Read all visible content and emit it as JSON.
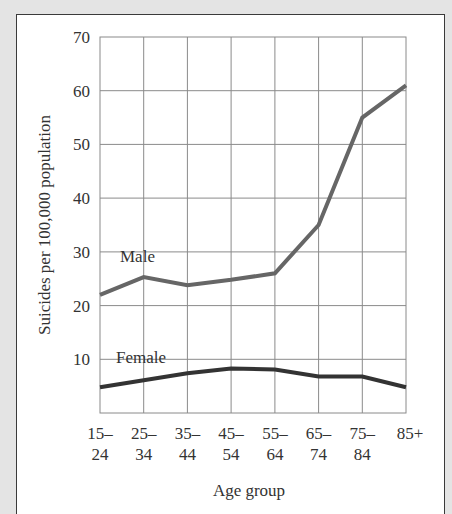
{
  "chart_data": {
    "type": "line",
    "title": "",
    "xlabel": "Age group",
    "ylabel": "Suicides per 100,000 population",
    "categories": [
      "15–24",
      "25–34",
      "35–44",
      "45–54",
      "55–64",
      "65–74",
      "75–84",
      "85+"
    ],
    "category_lines": [
      [
        "15–",
        "24"
      ],
      [
        "25–",
        "34"
      ],
      [
        "35–",
        "44"
      ],
      [
        "45–",
        "54"
      ],
      [
        "55–",
        "64"
      ],
      [
        "65–",
        "74"
      ],
      [
        "75–",
        "84"
      ],
      [
        "85+",
        ""
      ]
    ],
    "yticks": [
      10,
      20,
      30,
      40,
      50,
      60,
      70
    ],
    "ylim": [
      0,
      70
    ],
    "grid": true,
    "legend_position": "inline labels",
    "series": [
      {
        "name": "Male",
        "color": "#666666",
        "values": [
          22,
          25.3,
          23.8,
          24.8,
          26,
          35,
          55,
          61
        ]
      },
      {
        "name": "Female",
        "color": "#333333",
        "values": [
          4.8,
          6.1,
          7.4,
          8.3,
          8.1,
          6.8,
          6.8,
          4.8
        ]
      }
    ]
  },
  "labels": {
    "male": "Male",
    "female": "Female",
    "xlabel": "Age group",
    "ylabel": "Suicides per 100,000 population",
    "y70": "70",
    "y60": "60",
    "y50": "50",
    "y40": "40",
    "y30": "30",
    "y20": "20",
    "y10": "10",
    "x0a": "15–",
    "x0b": "24",
    "x1a": "25–",
    "x1b": "34",
    "x2a": "35–",
    "x2b": "44",
    "x3a": "45–",
    "x3b": "54",
    "x4a": "55–",
    "x4b": "64",
    "x5a": "65–",
    "x5b": "74",
    "x6a": "75–",
    "x6b": "84",
    "x7a": "85+"
  }
}
